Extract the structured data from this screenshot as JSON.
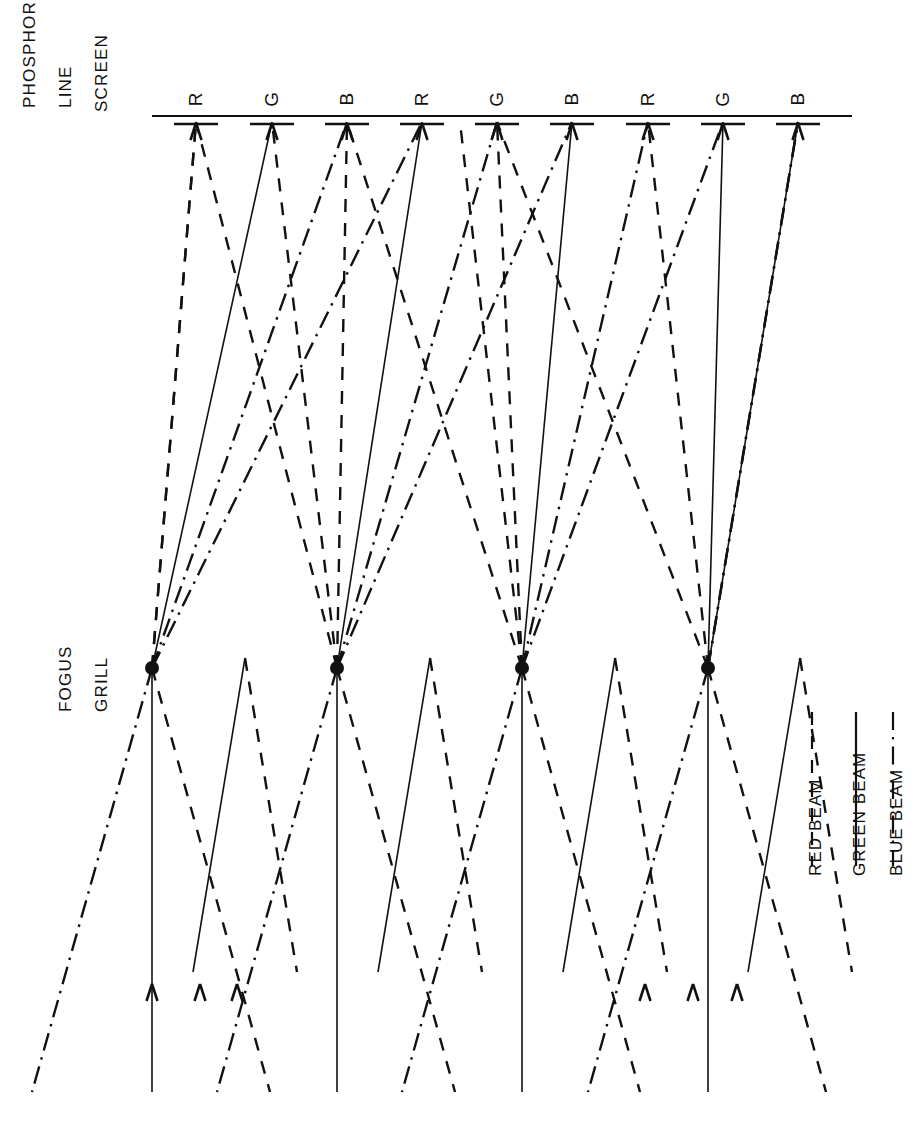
{
  "figure": {
    "type": "technical-line-diagram",
    "background_color": "#ffffff",
    "ink_color": "#111111"
  },
  "screen": {
    "label_lines": [
      "PHOSPHOR",
      "LINE",
      "SCREEN"
    ],
    "label_x": 18,
    "label_y": 30,
    "line_y": 116,
    "line_x_start": 152,
    "line_x_end": 852,
    "stripe_bar_y": 124,
    "stripe_half_width": 22,
    "stripe_labels": [
      "R",
      "G",
      "B",
      "R",
      "G",
      "B",
      "R",
      "G",
      "B"
    ],
    "stripe_x": [
      196,
      272,
      347,
      422,
      497,
      572,
      648,
      723,
      798
    ],
    "stripe_label_y": 88
  },
  "focus_grill": {
    "label_lines": [
      "FOGUS",
      "GRILL"
    ],
    "label_x": 52,
    "label_y": 628,
    "dot_y": 668,
    "dot_radius": 7,
    "dot_x": [
      152,
      337,
      522,
      708
    ]
  },
  "beams": {
    "source_y": 1092,
    "arrow_y": 984,
    "red": {
      "name": "RED BEAM",
      "style": "dashed",
      "dash": "13,11",
      "color": "#111111",
      "width": 2.4
    },
    "green": {
      "name": "GREEN BEAM",
      "style": "solid",
      "dash": "none",
      "color": "#111111",
      "width": 1.6
    },
    "blue": {
      "name": "BLUE BEAM",
      "style": "dash-dot",
      "dash": "18,7,2.5,7",
      "color": "#111111",
      "width": 2.4
    }
  },
  "legend": {
    "entries": [
      {
        "label": "RED BEAM",
        "style": "dashed",
        "dash": "13,11",
        "sample_x": 812,
        "label_x": 806
      },
      {
        "label": "GREEN BEAM",
        "style": "solid",
        "dash": "none",
        "sample_x": 856,
        "label_x": 850
      },
      {
        "label": "BLUE BEAM",
        "style": "dash-dot",
        "dash": "18,7,2.5,7",
        "sample_x": 893,
        "label_x": 887
      }
    ],
    "sample_y_top": 712,
    "sample_y_bottom": 866,
    "label_y": 876
  }
}
